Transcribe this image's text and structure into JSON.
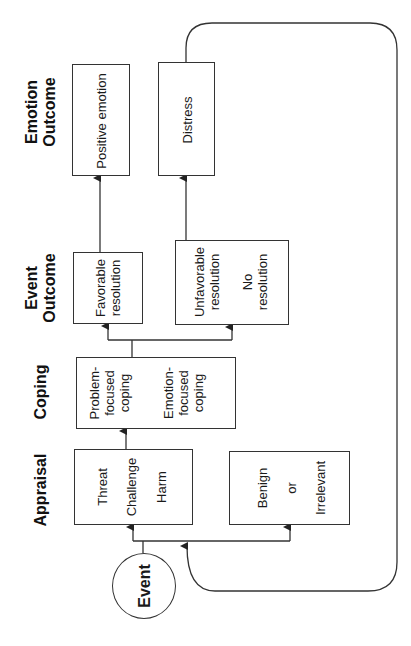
{
  "diagram": {
    "orientation": "rotated-90-ccw",
    "line_color": "#333333",
    "headers": {
      "emotion_outcome": "Emotion\nOutcome",
      "emotion_outcome_l1": "Emotion",
      "emotion_outcome_l2": "Outcome",
      "event_outcome_l1": "Event",
      "event_outcome_l2": "Outcome",
      "coping": "Coping",
      "appraisal": "Appraisal"
    },
    "event": {
      "label": "Event"
    },
    "appraisal": {
      "stressful": {
        "items": [
          "Threat",
          "Challenge",
          "Harm"
        ]
      },
      "non_stressful": {
        "items": [
          "Benign",
          "or",
          "Irrelevant"
        ]
      }
    },
    "coping": {
      "items": [
        {
          "line1": "Problem-",
          "line2": "focused",
          "line3": "coping"
        },
        {
          "line1": "Emotion-",
          "line2": "focused",
          "line3": "coping"
        }
      ]
    },
    "event_outcome": {
      "favorable": {
        "line1": "Favorable",
        "line2": "resolution"
      },
      "unfavorable": {
        "line1": "Unfavorable",
        "line2": "resolution",
        "line3": "No",
        "line4": "resolution"
      }
    },
    "emotion_outcome": {
      "positive": "Positive emotion",
      "distress": "Distress"
    }
  }
}
